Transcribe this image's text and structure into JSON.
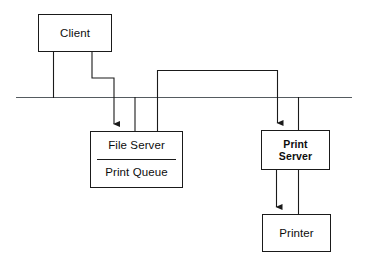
{
  "diagram": {
    "type": "network-bus-diagram",
    "background_color": "#ffffff",
    "line_color": "#1a1a1a",
    "text_color": "#0d0d0d",
    "canvas": {
      "width": 365,
      "height": 263
    },
    "nodes": [
      {
        "id": "client",
        "label": "Client",
        "bold": false,
        "x": 38,
        "y": 14,
        "width": 74,
        "height": 38
      },
      {
        "id": "file-server",
        "label": "File Server",
        "sub_label": "Print Queue",
        "bold": false,
        "divided": true,
        "x": 90,
        "y": 131,
        "width": 93,
        "height": 57
      },
      {
        "id": "print-server",
        "label_line1": "Print",
        "label_line2": "Server",
        "bold": true,
        "x": 261,
        "y": 130,
        "width": 69,
        "height": 40
      },
      {
        "id": "printer",
        "label": "Printer",
        "bold": false,
        "x": 262,
        "y": 214,
        "width": 69,
        "height": 38
      }
    ],
    "bus": {
      "id": "network-bus",
      "label": "network bus",
      "x1": 16,
      "x2": 352,
      "y": 97
    },
    "connections": [
      {
        "id": "client-to-bus",
        "label": "Client to bus tap",
        "arrow": false
      },
      {
        "id": "client-to-file-server",
        "label": "Client to File Server",
        "arrow": true
      },
      {
        "id": "file-server-to-bus",
        "label": "File Server to bus tap",
        "arrow": false
      },
      {
        "id": "file-server-to-print-server",
        "label": "File Server bridge to Print Server",
        "arrow": true
      },
      {
        "id": "print-server-to-bus",
        "label": "Print Server to bus tap",
        "arrow": false
      },
      {
        "id": "print-server-to-printer",
        "label": "Print Server to Printer",
        "arrow": true
      },
      {
        "id": "printer-to-print-server",
        "label": "Printer to Print Server link",
        "arrow": false
      }
    ]
  }
}
